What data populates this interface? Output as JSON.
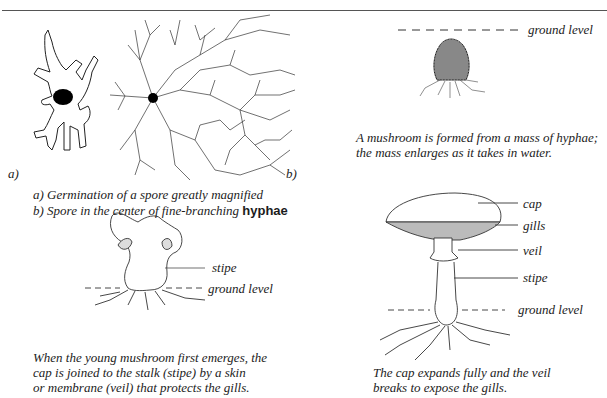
{
  "figure": {
    "panels": [
      {
        "id": "spore-germination",
        "markers": [
          "a)",
          "b)"
        ],
        "caption_lines": [
          "a) Germination of a spore greatly magnified",
          "b) Spore in the center of fine-branching"
        ],
        "caption_emphasis": "hyphae"
      },
      {
        "id": "hyphae-mass",
        "labels": [
          "ground level"
        ],
        "caption_lines": [
          "A mushroom is formed from a mass of hyphae;",
          "the mass enlarges as it takes in water."
        ]
      },
      {
        "id": "young-mushroom",
        "labels": [
          "stipe",
          "ground level"
        ],
        "caption_lines": [
          "When the young mushroom first emerges, the",
          "cap is joined to the stalk (stipe) by a skin",
          "or membrane (veil) that protects the gills."
        ]
      },
      {
        "id": "mature-mushroom",
        "labels": [
          "cap",
          "gills",
          "veil",
          "stipe",
          "ground level"
        ],
        "caption_lines": [
          "The cap expands fully and the veil",
          "breaks to expose the gills."
        ]
      }
    ]
  }
}
